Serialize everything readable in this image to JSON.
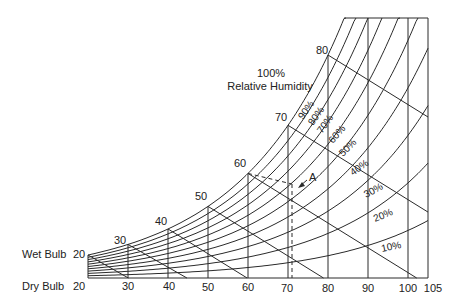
{
  "chart_data": {
    "type": "line",
    "xlabel": "Dry Bulb",
    "ylabel": "Wet Bulb",
    "xlim": [
      20,
      105
    ],
    "grid": false,
    "dry_bulb_ticks": [
      20,
      30,
      40,
      50,
      60,
      70,
      80,
      90,
      100,
      105
    ],
    "wet_bulb_ticks": [
      20,
      30,
      40,
      50,
      60,
      70,
      80
    ],
    "saturation_label": "100%\nRelative Humidity",
    "relative_humidity_curves": [
      {
        "name": "100%",
        "rh": 100
      },
      {
        "name": "90%",
        "rh": 90
      },
      {
        "name": "80%",
        "rh": 80
      },
      {
        "name": "70%",
        "rh": 70
      },
      {
        "name": "60%",
        "rh": 60
      },
      {
        "name": "50%",
        "rh": 50
      },
      {
        "name": "40%",
        "rh": 40
      },
      {
        "name": "30%",
        "rh": 30
      },
      {
        "name": "20%",
        "rh": 20
      },
      {
        "name": "10%",
        "rh": 10
      }
    ],
    "annotations": [
      {
        "label": "A",
        "dry_bulb": 73,
        "wet_bulb": 62,
        "rh_approx": 55,
        "style": "dashed guide lines to axis"
      }
    ]
  },
  "labels": {
    "wet_bulb": "Wet Bulb",
    "dry_bulb": "Dry Bulb",
    "rh_title_line1": "100%",
    "rh_title_line2": "Relative Humidity",
    "point_a": "A",
    "wb": [
      "20",
      "30",
      "40",
      "50",
      "60",
      "70",
      "80"
    ],
    "db": [
      "20",
      "30",
      "40",
      "50",
      "60",
      "70",
      "80",
      "90",
      "100",
      "105"
    ],
    "rh": [
      "90%",
      "80%",
      "70%",
      "60%",
      "50%",
      "40%",
      "30%",
      "20%",
      "10%"
    ]
  }
}
